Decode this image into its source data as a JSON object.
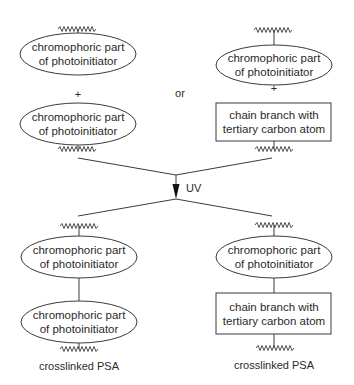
{
  "diagram": {
    "top_left": {
      "node1": {
        "line1": "chromophoric part",
        "line2": "of photoinitiator"
      },
      "plus": "+",
      "node2": {
        "line1": "chromophoric part",
        "line2": "of photoinitiator"
      }
    },
    "separator": "or",
    "top_right": {
      "node1": {
        "line1": "chromophoric part",
        "line2": "of photoinitiator"
      },
      "plus": "+",
      "node2": {
        "line1": "chain branch with",
        "line2": "tertiary carbon atom"
      }
    },
    "reaction": {
      "label": "UV"
    },
    "bottom_left": {
      "node1": {
        "line1": "chromophoric part",
        "line2": "of photoinitiator"
      },
      "node2": {
        "line1": "chromophoric part",
        "line2": "of photoinitiator"
      },
      "caption": "crosslinked PSA"
    },
    "bottom_right": {
      "node1": {
        "line1": "chromophoric part",
        "line2": "of photoinitiator"
      },
      "node2": {
        "line1": "chain branch with",
        "line2": "tertiary carbon atom"
      },
      "caption": "crosslinked PSA"
    }
  }
}
